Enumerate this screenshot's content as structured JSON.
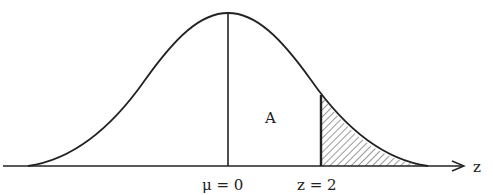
{
  "diagram": {
    "type": "normal-distribution",
    "mean_label": "μ = 0",
    "z_label": "z = 2",
    "region_label": "A",
    "axis_label": "z",
    "shaded_region": "right tail beyond z = 2",
    "colors": {
      "stroke": "#222222",
      "background": "#ffffff"
    }
  }
}
